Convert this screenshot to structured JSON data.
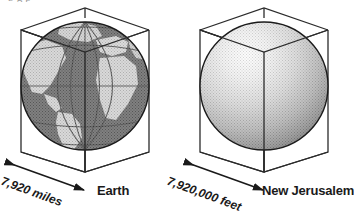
{
  "figure": {
    "clipped_top_caption": "b        g          p",
    "title_visible": false
  },
  "panels": [
    {
      "id": "earth",
      "name": "Earth",
      "label": "Earth",
      "dimension_label": "7,920 miles",
      "dimension_value": "7,920",
      "dimension_unit": "miles",
      "sphere_style": "textured-globe",
      "globe_features": {
        "view": "atlantic-centered",
        "grid": "latitude-longitude graticule",
        "ocean_color": "#4f4f4f",
        "land_color": "#c9c9c9"
      },
      "cube_label": "bounding-cube"
    },
    {
      "id": "new-jerusalem",
      "name": "New Jerusalem",
      "label": "New Jerusalem",
      "dimension_label": "7,920,000 feet",
      "dimension_value": "7,920,000",
      "dimension_unit": "feet",
      "sphere_style": "smooth-shaded",
      "cube_label": "bounding-cube"
    }
  ],
  "colors": {
    "ink": "#1a1a1a",
    "line": "#2b2b2b",
    "paper": "#ffffff",
    "sphere_light": "#f2f2f2",
    "sphere_mid": "#bdbdbd",
    "sphere_dark": "#5a5a5a",
    "ocean": "#4f4f4f",
    "land": "#c9c9c9",
    "caption_ghost": "#9a9a9a"
  },
  "icons": {
    "dimension_arrow": "double-headed-arrow-icon",
    "globe": "globe-icon",
    "sphere": "sphere-icon",
    "cube": "cube-wireframe-icon"
  }
}
